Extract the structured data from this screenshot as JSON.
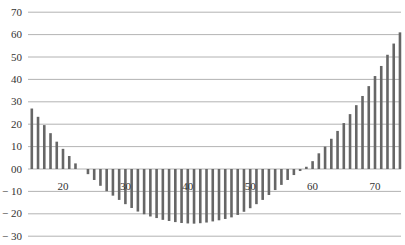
{
  "chart_data": {
    "type": "bar",
    "title": "",
    "xlabel": "",
    "ylabel": "",
    "x": [
      15,
      16,
      17,
      18,
      19,
      20,
      21,
      22,
      23,
      24,
      25,
      26,
      27,
      28,
      29,
      30,
      31,
      32,
      33,
      34,
      35,
      36,
      37,
      38,
      39,
      40,
      41,
      42,
      43,
      44,
      45,
      46,
      47,
      48,
      49,
      50,
      51,
      52,
      53,
      54,
      55,
      56,
      57,
      58,
      59,
      60,
      61,
      62,
      63,
      64,
      65,
      66,
      67,
      68,
      69,
      70,
      71,
      72,
      73,
      74
    ],
    "values": [
      27,
      23.3,
      19.6,
      16,
      12.2,
      9,
      5.8,
      2.5,
      0,
      -2.3,
      -4.9,
      -7.5,
      -9.9,
      -11.9,
      -13.8,
      -15.7,
      -17.4,
      -19,
      -20.2,
      -21.2,
      -21.9,
      -22.7,
      -23.2,
      -23.7,
      -24.1,
      -24.3,
      -24.4,
      -24.2,
      -23.9,
      -23.4,
      -22.9,
      -22.3,
      -21.6,
      -20.5,
      -19.1,
      -17.5,
      -15.7,
      -13.8,
      -11.6,
      -9.4,
      -7.1,
      -4.9,
      -2.7,
      -0.9,
      1,
      3.5,
      7,
      10,
      13.5,
      17,
      20.5,
      24.5,
      28.5,
      32.6,
      37,
      41.5,
      46,
      51,
      56,
      61
    ],
    "ylim": [
      -30,
      70
    ],
    "xlim": [
      14.5,
      75
    ],
    "y_ticks": [
      70,
      60,
      50,
      40,
      30,
      20,
      10,
      0,
      -10,
      -20,
      -30
    ],
    "y_tick_labels": [
      "70",
      "60",
      "50",
      "40",
      "30",
      "20",
      "10",
      "00",
      "− 10",
      "− 20",
      "− 30"
    ],
    "x_ticks": [
      20,
      30,
      40,
      50,
      60,
      70
    ],
    "x_tick_labels": [
      "20",
      "30",
      "40",
      "50",
      "60",
      "70"
    ],
    "grid": true,
    "legend": null,
    "colors": {
      "bar": "#666666",
      "grid": "#a0a0a0",
      "text": "#333333"
    }
  }
}
